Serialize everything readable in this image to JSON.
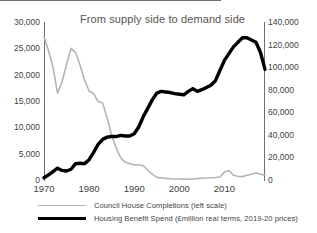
{
  "chart_data": {
    "type": "line",
    "title": "From supply side to demand side",
    "xlabel": "",
    "ylabel": "",
    "grid": false,
    "legend_position": "bottom-left",
    "x": [
      1970,
      1971,
      1972,
      1973,
      1974,
      1975,
      1976,
      1977,
      1978,
      1979,
      1980,
      1981,
      1982,
      1983,
      1984,
      1985,
      1986,
      1987,
      1988,
      1989,
      1990,
      1991,
      1992,
      1993,
      1994,
      1995,
      1996,
      1997,
      1998,
      1999,
      2000,
      2001,
      2002,
      2003,
      2004,
      2005,
      2006,
      2007,
      2008,
      2009,
      2010,
      2011,
      2012,
      2013,
      2014,
      2015,
      2016,
      2017,
      2018,
      2019
    ],
    "xlim": [
      1970,
      2019
    ],
    "xticks": [
      1970,
      1980,
      1990,
      2000,
      2010
    ],
    "xticklabels": [
      "1970",
      "1980",
      "1990",
      "2000",
      "2010"
    ],
    "axes": [
      {
        "id": "left",
        "name": "Council House Completions (left scale)",
        "ylim": [
          0,
          30000
        ],
        "yticks": [
          0,
          5000,
          10000,
          15000,
          20000,
          25000,
          30000
        ],
        "yticklabels": [
          "0",
          "5,000",
          "10,000",
          "15,000",
          "20,000",
          "25,000",
          "30,000"
        ]
      },
      {
        "id": "right",
        "name": "Housing Benefit Spend (£million real terms, 2019-20 prices)",
        "ylim": [
          0,
          140000
        ],
        "yticks": [
          0,
          20000,
          40000,
          60000,
          80000,
          100000,
          120000,
          140000
        ],
        "yticklabels": [
          "0",
          "20,000",
          "40,000",
          "60,000",
          "80,000",
          "100,000",
          "120,000",
          "140,000"
        ]
      }
    ],
    "series": [
      {
        "name": "Council House Completions (left scale)",
        "axis": "left",
        "color": "#b4b4b4",
        "width": 1.6,
        "values": [
          27200,
          24600,
          21400,
          16500,
          18600,
          22000,
          25000,
          24200,
          21800,
          19000,
          16900,
          16400,
          14900,
          14600,
          11800,
          8500,
          6100,
          4200,
          3400,
          3100,
          2900,
          2900,
          2700,
          1900,
          1100,
          500,
          400,
          300,
          250,
          200,
          180,
          160,
          150,
          200,
          260,
          320,
          380,
          430,
          480,
          560,
          1500,
          1800,
          900,
          700,
          650,
          900,
          1100,
          1400,
          1100,
          950
        ]
      },
      {
        "name": "Housing Benefit Spend (£million real terms, 2019-20 prices)",
        "axis": "right",
        "color": "#000000",
        "width": 3.4,
        "values": [
          2000,
          4500,
          7500,
          10500,
          8500,
          8000,
          9500,
          14500,
          14800,
          14500,
          18000,
          24500,
          31500,
          36000,
          38000,
          38500,
          38500,
          39500,
          39000,
          39000,
          41000,
          47000,
          56000,
          63500,
          71000,
          77000,
          78500,
          78000,
          77500,
          76500,
          76000,
          75500,
          78500,
          81000,
          78500,
          80000,
          82000,
          84000,
          88000,
          97000,
          106000,
          112000,
          118000,
          122000,
          126000,
          126000,
          124000,
          122000,
          113000,
          98000
        ]
      }
    ]
  },
  "legend": {
    "items": [
      {
        "label": "Council House Completions (left scale)",
        "style": "grey"
      },
      {
        "label": "Housing Benefit Spend (£million real terms, 2019-20 prices)",
        "style": "black"
      }
    ]
  }
}
